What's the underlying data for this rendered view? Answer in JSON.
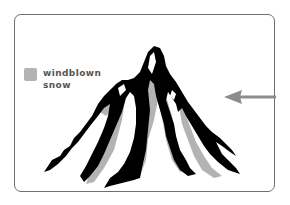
{
  "diagram": {
    "legend": {
      "label": "windblown\nsnow",
      "swatch_color": "#b3b3b3"
    },
    "arrow": {
      "direction": "left",
      "color": "#8c8c8c",
      "meaning": "wind"
    },
    "colors": {
      "rock": "#000000",
      "snow": "#b3b3b3",
      "frame": "#6e6e6e",
      "background": "#ffffff"
    }
  }
}
